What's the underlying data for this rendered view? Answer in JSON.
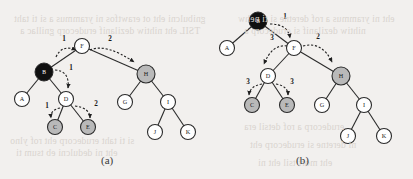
{
  "figure": {
    "width": 413,
    "height": 179,
    "background_color": "#f2f0ee",
    "node_fill_white": "#ffffff",
    "node_fill_gray": "#b9b9b9",
    "node_fill_black": "#101010",
    "stroke_color": "#2b2b2b",
    "label_color_on_light": "#1a1a1a",
    "label_color_on_dark": "#ffffff"
  },
  "bleed_text": [
    {
      "text": "gnibulcni eht ot erawtfos ni yrammus a si ti taht",
      "x": 14,
      "y": 14,
      "size": 9.5
    },
    {
      "text": "TSIL eht nihtiw dezilanif erudecorp gnillac a",
      "x": 20,
      "y": 26,
      "size": 9.5
    },
    {
      "text": "eht ni yrammus a rof deretne si ti nehw",
      "x": 238,
      "y": 14,
      "size": 9.5
    },
    {
      "text": "nihtiw dezilanif si erudecorp a",
      "x": 244,
      "y": 26,
      "size": 9.5
    },
    {
      "text": "si ti taht erudecorp eht rof ylno",
      "x": 10,
      "y": 136,
      "size": 9.5
    },
    {
      "text": "eht ni dedulcni eb tsum ti",
      "x": 16,
      "y": 148,
      "size": 9.5
    },
    {
      "text": "erudecorp a rof detsil era",
      "x": 244,
      "y": 122,
      "size": 9.5
    },
    {
      "text": "ni deretne si erudecorp eht",
      "x": 250,
      "y": 140,
      "size": 9.5
    },
    {
      "text": "eht morf tsil eht ni",
      "x": 258,
      "y": 158,
      "size": 9.5
    }
  ],
  "captions": [
    {
      "id": "caption-a",
      "label": "(a)",
      "x": 101,
      "y": 154
    },
    {
      "id": "caption-b",
      "label": "(b)",
      "x": 296,
      "y": 154
    }
  ],
  "diagram_a": {
    "name": "tree-diagram-a",
    "nodes": [
      {
        "id": "a-F",
        "label": "F",
        "x": 82,
        "y": 46,
        "r": 7.5,
        "fill": "white"
      },
      {
        "id": "a-B",
        "label": "B",
        "x": 44,
        "y": 72,
        "r": 9.0,
        "fill": "black"
      },
      {
        "id": "a-H",
        "label": "H",
        "x": 146,
        "y": 74,
        "r": 9.0,
        "fill": "gray"
      },
      {
        "id": "a-A",
        "label": "A",
        "x": 22,
        "y": 99,
        "r": 7.5,
        "fill": "white"
      },
      {
        "id": "a-D",
        "label": "D",
        "x": 66,
        "y": 99,
        "r": 7.5,
        "fill": "white"
      },
      {
        "id": "a-G",
        "label": "G",
        "x": 125,
        "y": 102,
        "r": 7.5,
        "fill": "white"
      },
      {
        "id": "a-I",
        "label": "I",
        "x": 168,
        "y": 102,
        "r": 7.5,
        "fill": "white"
      },
      {
        "id": "a-C",
        "label": "C",
        "x": 55,
        "y": 127,
        "r": 7.5,
        "fill": "gray"
      },
      {
        "id": "a-E",
        "label": "E",
        "x": 88,
        "y": 127,
        "r": 7.5,
        "fill": "gray"
      },
      {
        "id": "a-J",
        "label": "J",
        "x": 155,
        "y": 132,
        "r": 7.5,
        "fill": "white"
      },
      {
        "id": "a-K",
        "label": "K",
        "x": 188,
        "y": 132,
        "r": 7.5,
        "fill": "white"
      }
    ],
    "edges": [
      {
        "from": "a-F",
        "to": "a-B"
      },
      {
        "from": "a-F",
        "to": "a-H"
      },
      {
        "from": "a-B",
        "to": "a-A"
      },
      {
        "from": "a-B",
        "to": "a-D"
      },
      {
        "from": "a-H",
        "to": "a-G"
      },
      {
        "from": "a-H",
        "to": "a-I"
      },
      {
        "from": "a-D",
        "to": "a-C"
      },
      {
        "from": "a-D",
        "to": "a-E"
      },
      {
        "from": "a-I",
        "to": "a-J"
      },
      {
        "from": "a-I",
        "to": "a-K"
      }
    ],
    "traversal_arrows": [
      {
        "id": "a-arrow-1",
        "label": "1",
        "path": "M 56 57 Q 62 44 76 50",
        "label_x": 64,
        "label_y": 41
      },
      {
        "id": "a-arrow-2",
        "label": "2",
        "path": "M 90 50 Q 106 43 134 62",
        "label_x": 110,
        "label_y": 41
      },
      {
        "id": "a-arrow-3",
        "label": "1",
        "path": "M 55 70 Q 70 71 68 88",
        "label_x": 71,
        "label_y": 70
      },
      {
        "id": "a-arrow-4",
        "label": "1",
        "path": "M 60 108 Q 50 110 51 118",
        "label_x": 47,
        "label_y": 108
      },
      {
        "id": "a-arrow-5",
        "label": "2",
        "path": "M 75 106 Q 90 108 90 118",
        "label_x": 96,
        "label_y": 106
      }
    ]
  },
  "diagram_b": {
    "name": "tree-diagram-b",
    "nodes": [
      {
        "id": "b-B",
        "label": "B",
        "x": 258,
        "y": 21,
        "r": 9.0,
        "fill": "black"
      },
      {
        "id": "b-A",
        "label": "A",
        "x": 227,
        "y": 48,
        "r": 7.5,
        "fill": "white"
      },
      {
        "id": "b-F",
        "label": "F",
        "x": 294,
        "y": 48,
        "r": 7.5,
        "fill": "white"
      },
      {
        "id": "b-D",
        "label": "D",
        "x": 268,
        "y": 76,
        "r": 7.5,
        "fill": "white"
      },
      {
        "id": "b-H",
        "label": "H",
        "x": 341,
        "y": 76,
        "r": 9.0,
        "fill": "gray"
      },
      {
        "id": "b-C",
        "label": "C",
        "x": 252,
        "y": 105,
        "r": 7.5,
        "fill": "gray"
      },
      {
        "id": "b-E",
        "label": "E",
        "x": 287,
        "y": 105,
        "r": 7.5,
        "fill": "gray"
      },
      {
        "id": "b-G",
        "label": "G",
        "x": 322,
        "y": 105,
        "r": 7.5,
        "fill": "white"
      },
      {
        "id": "b-I",
        "label": "I",
        "x": 364,
        "y": 105,
        "r": 7.5,
        "fill": "white"
      },
      {
        "id": "b-J",
        "label": "J",
        "x": 348,
        "y": 136,
        "r": 7.5,
        "fill": "white"
      },
      {
        "id": "b-K",
        "label": "K",
        "x": 384,
        "y": 136,
        "r": 7.5,
        "fill": "white"
      }
    ],
    "edges": [
      {
        "from": "b-B",
        "to": "b-A"
      },
      {
        "from": "b-B",
        "to": "b-F"
      },
      {
        "from": "b-F",
        "to": "b-D"
      },
      {
        "from": "b-F",
        "to": "b-H"
      },
      {
        "from": "b-D",
        "to": "b-C"
      },
      {
        "from": "b-D",
        "to": "b-E"
      },
      {
        "from": "b-H",
        "to": "b-G"
      },
      {
        "from": "b-H",
        "to": "b-I"
      },
      {
        "from": "b-I",
        "to": "b-J"
      },
      {
        "from": "b-I",
        "to": "b-K"
      }
    ],
    "traversal_arrows": [
      {
        "id": "b-arrow-1",
        "label": "1",
        "path": "M 270 24 Q 288 24 290 38",
        "label_x": 285,
        "label_y": 19
      },
      {
        "id": "b-arrow-2",
        "label": "3",
        "path": "M 287 46 Q 272 44 264 64",
        "label_x": 272,
        "label_y": 40
      },
      {
        "id": "b-arrow-3",
        "label": "2",
        "path": "M 303 46 Q 322 41 332 62",
        "label_x": 318,
        "label_y": 39
      },
      {
        "id": "b-arrow-4",
        "label": "3",
        "path": "M 262 84 Q 250 86 249 95",
        "label_x": 248,
        "label_y": 84
      },
      {
        "id": "b-arrow-5",
        "label": "3",
        "path": "M 276 84 Q 288 86 288 95",
        "label_x": 292,
        "label_y": 84
      }
    ]
  }
}
